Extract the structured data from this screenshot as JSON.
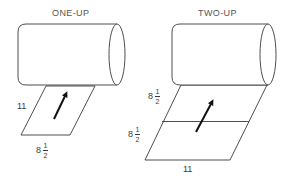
{
  "figure": {
    "panels": [
      {
        "title": "ONE-UP",
        "sheet_label_side": "11",
        "sheet_label_bottom": {
          "whole": "8",
          "num": "1",
          "den": "2"
        }
      },
      {
        "title": "TWO-UP",
        "sheet_label_upper": {
          "whole": "8",
          "num": "1",
          "den": "2"
        },
        "sheet_label_lower": {
          "whole": "8",
          "num": "1",
          "den": "2"
        },
        "sheet_label_bottom": "11"
      }
    ],
    "colors": {
      "line": "#3a3a3a",
      "background": "#ffffff",
      "arrow": "#111111"
    }
  }
}
